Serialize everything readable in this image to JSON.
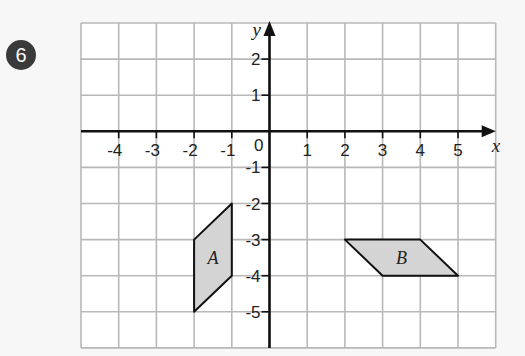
{
  "question_number": "6",
  "axes": {
    "x_label": "x",
    "y_label": "y",
    "origin_label": "0",
    "x_ticks": [
      "-4",
      "-3",
      "-2",
      "-1",
      "1",
      "2",
      "3",
      "4",
      "5"
    ],
    "y_ticks": [
      "2",
      "1",
      "-1",
      "-2",
      "-3",
      "-4",
      "-5"
    ]
  },
  "shapes": [
    {
      "label": "A",
      "vertices": [
        [
          -2,
          -3
        ],
        [
          -1,
          -2
        ],
        [
          -1,
          -4
        ],
        [
          -2,
          -5
        ]
      ],
      "fill": "#d4d4d4"
    },
    {
      "label": "B",
      "vertices": [
        [
          2,
          -3
        ],
        [
          4,
          -3
        ],
        [
          5,
          -4
        ],
        [
          3,
          -4
        ]
      ],
      "fill": "#d4d4d4"
    }
  ],
  "colors": {
    "grid": "#b8b8b8",
    "axis": "#111111",
    "badge": "#3a3a3a"
  },
  "chart_data": {
    "type": "diagram",
    "title": "",
    "xlabel": "x",
    "ylabel": "y",
    "xlim": [
      -5,
      6
    ],
    "ylim": [
      -6,
      3
    ],
    "grid": true,
    "polygons": [
      {
        "name": "A",
        "points": [
          [
            -2,
            -3
          ],
          [
            -1,
            -2
          ],
          [
            -1,
            -4
          ],
          [
            -2,
            -5
          ]
        ]
      },
      {
        "name": "B",
        "points": [
          [
            2,
            -3
          ],
          [
            4,
            -3
          ],
          [
            5,
            -4
          ],
          [
            3,
            -4
          ]
        ]
      }
    ]
  }
}
